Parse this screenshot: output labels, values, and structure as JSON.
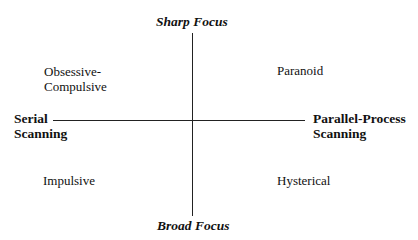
{
  "diagram": {
    "vertical_axis": {
      "top_label": "Sharp Focus",
      "bottom_label": "Broad Focus"
    },
    "horizontal_axis": {
      "left_label_line1": "Serial",
      "left_label_line2": "Scanning",
      "right_label_line1": "Parallel-Process",
      "right_label_line2": "Scanning"
    },
    "quadrants": {
      "top_left_line1": "Obsessive-",
      "top_left_line2": "Compulsive",
      "top_right": "Paranoid",
      "bottom_left": "Impulsive",
      "bottom_right": "Hysterical"
    }
  }
}
